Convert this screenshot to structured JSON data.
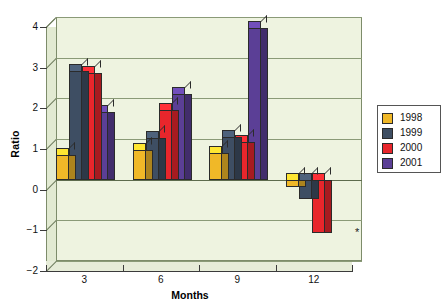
{
  "chart_data": {
    "type": "bar",
    "title": "",
    "xlabel": "Months",
    "ylabel": "Ratio",
    "categories": [
      "3",
      "6",
      "9",
      "12"
    ],
    "ylim": [
      -2,
      4
    ],
    "yticks": [
      "4",
      "3",
      "2",
      "1",
      "0",
      "-1",
      "-2"
    ],
    "grid": true,
    "legend_position": "right",
    "series": [
      {
        "name": "1998",
        "color": "#F0B828",
        "values": [
          0.6,
          0.72,
          0.65,
          -0.17
        ]
      },
      {
        "name": "1999",
        "color": "#3E4E63",
        "values": [
          2.68,
          1.02,
          1.05,
          -0.48
        ]
      },
      {
        "name": "2000",
        "color": "#E8262C",
        "values": [
          2.62,
          1.72,
          0.92,
          -1.32
        ]
      },
      {
        "name": "2001",
        "color": "#5B3F96",
        "values": [
          1.66,
          2.1,
          3.73,
          0.0
        ]
      }
    ],
    "annotations": [
      {
        "text": "*",
        "x": 355,
        "y": 228
      }
    ]
  },
  "style": {
    "plot_background": "#eef3e0",
    "grid_color": "#8a9a77",
    "axis_color": "#3b3b3b"
  }
}
